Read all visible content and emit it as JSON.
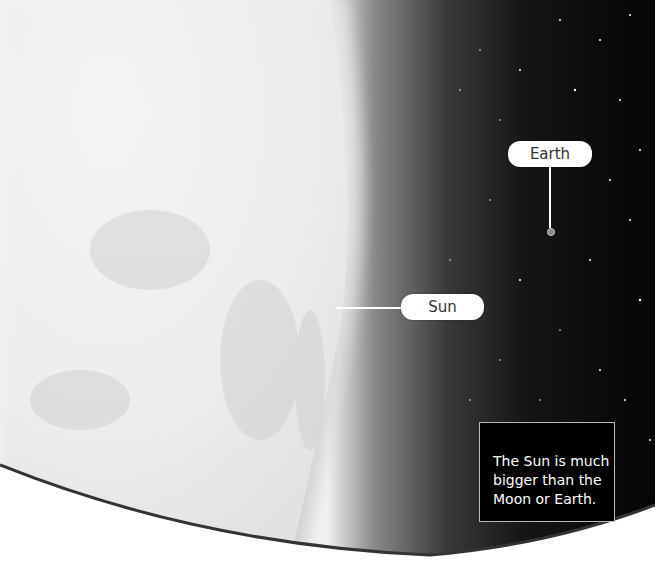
{
  "labels": {
    "earth": "Earth",
    "sun": "Sun"
  },
  "caption": {
    "line1": "The Sun is much",
    "line2": "bigger than the",
    "line3": "Moon or Earth."
  },
  "colors": {
    "space": "#0a0a0a",
    "sun_surface": "#f2f2f2",
    "label_bg": "#ffffff",
    "caption_bg": "#000000",
    "curve": "#333333"
  }
}
